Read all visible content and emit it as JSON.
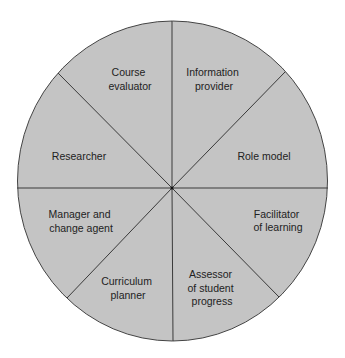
{
  "diagram": {
    "type": "wheel",
    "fill_color": "#c4c4c4",
    "line_color": "#3a3a3a",
    "text_color": "#222222",
    "segments": [
      {
        "lines": [
          "Information",
          "provider"
        ]
      },
      {
        "lines": [
          "Role model"
        ]
      },
      {
        "lines": [
          "Facilitator",
          "of learning"
        ]
      },
      {
        "lines": [
          "Assessor",
          "of student",
          "progress"
        ]
      },
      {
        "lines": [
          "Curriculum",
          "planner"
        ]
      },
      {
        "lines": [
          "Manager and",
          "change agent"
        ]
      },
      {
        "lines": [
          "Researcher"
        ]
      },
      {
        "lines": [
          "Course",
          "evaluator"
        ]
      }
    ]
  }
}
